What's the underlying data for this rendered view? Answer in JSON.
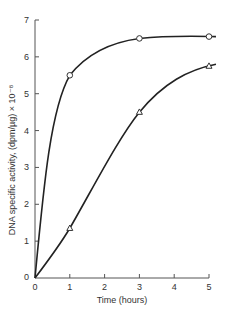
{
  "chart_data": {
    "type": "line",
    "title": "",
    "xlabel": "Time (hours)",
    "ylabel": "DNA specific activity, (dpm/µg) × 10⁻⁸",
    "xlim": [
      0,
      5
    ],
    "ylim": [
      0,
      7
    ],
    "x_ticks": [
      "0",
      "1",
      "2",
      "3",
      "4",
      "5"
    ],
    "y_ticks": [
      "0",
      "1",
      "2",
      "3",
      "4",
      "5",
      "6",
      "7"
    ],
    "grid": false,
    "legend": null,
    "series": [
      {
        "name": "upper curve (circles)",
        "marker": "circle",
        "points": [
          [
            0,
            0
          ],
          [
            1,
            5.5
          ],
          [
            3,
            6.5
          ],
          [
            5,
            6.55
          ]
        ]
      },
      {
        "name": "lower curve (triangles)",
        "marker": "triangle",
        "points": [
          [
            0,
            0
          ],
          [
            1,
            1.35
          ],
          [
            3,
            4.5
          ],
          [
            5,
            5.75
          ]
        ]
      }
    ]
  },
  "axis": {
    "x_title": "Time (hours)",
    "y_title": "DNA specific activity, (dpm/µg) × 10⁻⁸",
    "x_origin_label": "0"
  }
}
